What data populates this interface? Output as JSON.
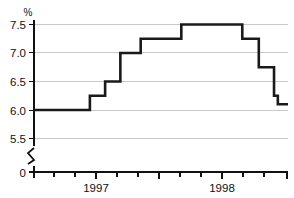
{
  "chart_data": {
    "type": "line",
    "subtype": "step",
    "title": "",
    "xlabel": "",
    "ylabel": "%",
    "unit_label": "%",
    "ylim": [
      5.35,
      7.65
    ],
    "yticks": [
      5.5,
      6.0,
      6.5,
      7.0,
      7.5
    ],
    "ytick_labels": [
      "5.5",
      "6.0",
      "6.5",
      "7.0",
      "7.5"
    ],
    "zero_label": "0",
    "axis_break": true,
    "grid": true,
    "grid_axis": "y",
    "legend": "none",
    "xtick_labels": [
      "1997",
      "1998"
    ],
    "x_major_ticks": [
      "1997",
      "1998"
    ],
    "x_minor_tick_count": 11,
    "line_color": "#1a1a1a",
    "grid_color": "#c9c9c9",
    "axis_color": "#111111",
    "background_color": "#ffffff",
    "x": [
      0.0,
      0.22,
      0.22,
      0.28,
      0.28,
      0.34,
      0.34,
      0.42,
      0.42,
      0.58,
      0.58,
      0.82,
      0.82,
      0.885,
      0.885,
      0.945,
      0.945,
      0.96,
      0.96,
      0.975,
      0.975,
      1.0
    ],
    "values": [
      6.0,
      6.0,
      6.25,
      6.25,
      6.5,
      6.5,
      7.0,
      7.0,
      7.25,
      7.25,
      7.5,
      7.5,
      7.25,
      7.25,
      6.75,
      6.75,
      6.25,
      6.25,
      6.1,
      6.1,
      6.1,
      6.1
    ],
    "step_levels": [
      6.0,
      6.25,
      6.5,
      7.0,
      7.25,
      7.5,
      7.25,
      6.75,
      6.25,
      6.1
    ],
    "step_level_labels": [
      "6.0",
      "6.25",
      "6.5",
      "7.0",
      "7.25",
      "7.5",
      "7.25",
      "6.75",
      "6.25",
      "6.1"
    ]
  },
  "geometry": {
    "plot_left": 33,
    "plot_right": 288,
    "plot_top": 24,
    "plot_bottom": 138,
    "axis_baseline_y": 172,
    "break_top_y": 146,
    "break_bottom_y": 166
  }
}
